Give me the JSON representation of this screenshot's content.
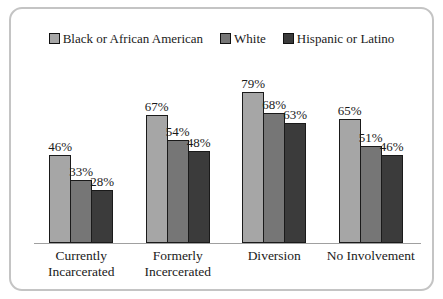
{
  "chart_data": {
    "type": "bar",
    "title": "",
    "xlabel": "",
    "ylabel": "",
    "ylim": [
      0,
      100
    ],
    "grid": false,
    "legend_position": "top-center",
    "label_suffix": "%",
    "categories": [
      "Currently\nIncarcerated",
      "Formerly\nIncercerated",
      "Diversion",
      "No Involvement"
    ],
    "series": [
      {
        "name": "Black or African American",
        "color": "#a6a6a6",
        "values": [
          46,
          67,
          79,
          65
        ]
      },
      {
        "name": "White",
        "color": "#767676",
        "values": [
          33,
          54,
          68,
          51
        ]
      },
      {
        "name": "Hispanic or Latino",
        "color": "#3b3b3b",
        "values": [
          28,
          48,
          63,
          46
        ]
      }
    ],
    "colors": {
      "bar_border": "#1a1a1a",
      "axis_line": "#a0a0a0",
      "frame_border": "#c4c4c4",
      "text": "#1a1a1a",
      "background": "#ffffff"
    }
  }
}
